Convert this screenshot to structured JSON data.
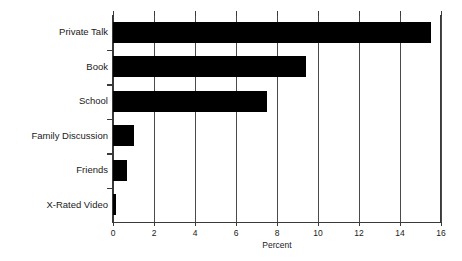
{
  "chart_data": {
    "type": "bar",
    "orientation": "horizontal",
    "title": "",
    "xlabel": "Percent",
    "ylabel": "",
    "categories": [
      "Private Talk",
      "Book",
      "School",
      "Family Discussion",
      "Friends",
      "X-Rated Video"
    ],
    "values": [
      15.5,
      9.4,
      7.5,
      1.0,
      0.7,
      0.15
    ],
    "xlim": [
      0,
      16
    ],
    "xticks": [
      0,
      2,
      4,
      6,
      8,
      10,
      12,
      14,
      16
    ],
    "xtick_labels": [
      "0",
      "2",
      "4",
      "6",
      "8",
      "10",
      "12",
      "14",
      "16"
    ],
    "grid": "vertical",
    "legend": "none",
    "bar_color": "#000000",
    "background_color": "#ffffff",
    "axis_color": "#3a3a3a"
  },
  "axis": {
    "x_title": "Percent"
  }
}
